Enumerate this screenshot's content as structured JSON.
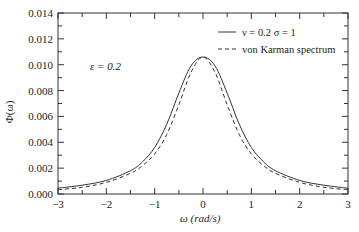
{
  "chart_data": {
    "type": "line",
    "title": "",
    "xlabel": "ω (rad/s)",
    "ylabel": "Φ(ω)",
    "xlim": [
      -3,
      3
    ],
    "ylim": [
      0,
      0.014
    ],
    "grid": false,
    "legend_position": "upper right",
    "x_ticks": [
      -3,
      -2,
      -1,
      0,
      1,
      2,
      3
    ],
    "x_tick_labels": [
      "−3",
      "−2",
      "−1",
      "0",
      "1",
      "2",
      "3"
    ],
    "y_ticks": [
      0,
      0.002,
      0.004,
      0.006,
      0.008,
      0.01,
      0.012,
      0.014
    ],
    "y_tick_labels": [
      "0.000",
      "0.002",
      "0.004",
      "0.006",
      "0.008",
      "0.010",
      "0.012",
      "0.014"
    ],
    "annotation": "ε = 0.2",
    "x": [
      -3,
      -2.5,
      -2,
      -1.5,
      -1.25,
      -1,
      -0.75,
      -0.5,
      -0.25,
      0,
      0.25,
      0.5,
      0.75,
      1,
      1.25,
      1.5,
      2,
      2.5,
      3
    ],
    "series": [
      {
        "name": "ν = 0.2  σ = 1",
        "style": "solid",
        "values": [
          0.00045,
          0.00068,
          0.00105,
          0.0018,
          0.0025,
          0.0036,
          0.0054,
          0.0078,
          0.0099,
          0.0106,
          0.0099,
          0.0078,
          0.0054,
          0.0036,
          0.0025,
          0.0018,
          0.00105,
          0.00068,
          0.00045
        ]
      },
      {
        "name": "von Karman spectrum",
        "style": "dashed",
        "values": [
          0.00033,
          0.00052,
          0.0009,
          0.0016,
          0.0022,
          0.0031,
          0.0046,
          0.0069,
          0.0094,
          0.0106,
          0.0094,
          0.0069,
          0.0046,
          0.0031,
          0.0022,
          0.0016,
          0.0009,
          0.00052,
          0.00033
        ]
      }
    ]
  },
  "legend": {
    "items": [
      {
        "label": "ν = 0.2  σ = 1",
        "style": "solid"
      },
      {
        "label": "von Karman spectrum",
        "style": "dashed"
      }
    ]
  },
  "annotation": {
    "text": "ε = 0.2"
  },
  "axes": {
    "xlabel": "ω (rad/s)",
    "ylabel": "Φ(ω)"
  }
}
